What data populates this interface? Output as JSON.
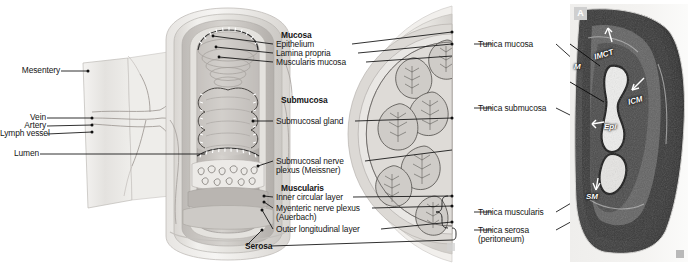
{
  "figure": {
    "background": "#ffffff",
    "width": 692,
    "height": 270
  },
  "panels": {
    "cutaway": {
      "name": "three-dimensional cutaway of intestinal wall"
    },
    "cross_section": {
      "name": "cross section of intestinal wall",
      "badge": "b"
    },
    "micrograph": {
      "name": "light micrograph of intestinal wall",
      "badge": "A",
      "corner_badge": "c"
    }
  },
  "left_labels": [
    {
      "id": "mesentery",
      "text": "Mesentery"
    },
    {
      "id": "vein",
      "text": "Vein"
    },
    {
      "id": "artery",
      "text": "Artery"
    },
    {
      "id": "lymph-vessel",
      "text": "Lymph vessel"
    },
    {
      "id": "lumen",
      "text": "Lumen"
    }
  ],
  "center_labels": {
    "mucosa_heading": "Mucosa",
    "mucosa_items": [
      {
        "id": "epithelium",
        "text": "Epithelium"
      },
      {
        "id": "lamina-propria",
        "text": "Lamina propria"
      },
      {
        "id": "muscularis-mucosa",
        "text": "Muscularis mucosa"
      }
    ],
    "submucosa_heading": "Submucosa",
    "submucosa_items": [
      {
        "id": "submucosal-gland",
        "text": "Submucosal gland"
      }
    ],
    "submucosal_plexus": {
      "id": "submucosal-nerve-plexus",
      "line1": "Submucosal nerve",
      "line2": "plexus (Meissner)"
    },
    "muscularis_heading": "Muscularis",
    "muscularis_items": [
      {
        "id": "inner-circular-layer",
        "line1": "Inner circular layer",
        "line2": ""
      },
      {
        "id": "myenteric-nerve-plexus",
        "line1": "Myenteric nerve plexus",
        "line2": "(Auerbach)"
      },
      {
        "id": "outer-longitudinal-layer",
        "line1": "Outer longitudinal layer",
        "line2": ""
      }
    ],
    "serosa_heading": "Serosa"
  },
  "right_labels": [
    {
      "id": "tunica-mucosa",
      "line1": "Tunica mucosa",
      "line2": ""
    },
    {
      "id": "tunica-submucosa",
      "line1": "Tunica submucosa",
      "line2": ""
    },
    {
      "id": "tunica-muscularis",
      "line1": "Tunica muscularis",
      "line2": ""
    },
    {
      "id": "tunica-serosa",
      "line1": "Tunica serosa",
      "line2": "(peritoneum)"
    }
  ],
  "micrograph_labels": [
    {
      "id": "imct",
      "text": "IMCT"
    },
    {
      "id": "m",
      "text": "M"
    },
    {
      "id": "icm",
      "text": "ICM"
    },
    {
      "id": "epi",
      "text": "Epi"
    },
    {
      "id": "sm",
      "text": "SM"
    }
  ],
  "colors": {
    "ink": "#151515",
    "leader": "#1a1a1a",
    "paper": "#ffffff",
    "tissue_light": "#e9e7e4",
    "tissue_mid": "#c9c6c2",
    "tissue_dark": "#a8a4a0",
    "serosa": "#dcdad7",
    "vessel": "#b3aeab"
  }
}
